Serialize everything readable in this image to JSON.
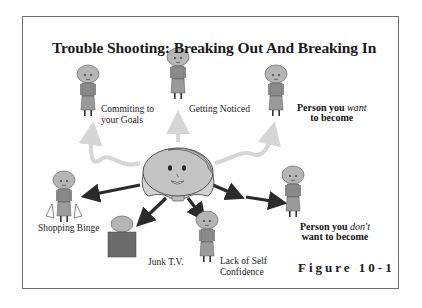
{
  "diagram": {
    "title": "Trouble Shooting: Breaking Out And Breaking In",
    "figure_label": "Figure 10-1",
    "center": {
      "name": "self-face",
      "description": "Central smiling face with bob haircut"
    },
    "positive_paths": [
      {
        "id": "commiting",
        "line1": "Commiting to",
        "line2": "your Goals",
        "arrow": "light-gray-wavy"
      },
      {
        "id": "noticed",
        "line1": "Getting Noticed",
        "arrow": "light-gray-straight"
      },
      {
        "id": "want",
        "line1_pre": "Person you ",
        "line1_em": "want",
        "line2": "to become",
        "arrow": "light-gray-wavy"
      }
    ],
    "negative_paths": [
      {
        "id": "shopping",
        "line1": "Shopping Binge",
        "arrow": "dark"
      },
      {
        "id": "junk-tv",
        "line1": "Junk T.V.",
        "arrow": "dark"
      },
      {
        "id": "confidence",
        "line1": "Lack of Self",
        "line2": "Confidence",
        "arrow": "dark"
      },
      {
        "id": "dont-want",
        "line1_pre": "Person you ",
        "line1_em": "don't",
        "line2": "want to become",
        "arrow": "dark-double"
      }
    ],
    "colors": {
      "frame": "#6e6e6e",
      "dark_arrow": "#2b2b2b",
      "light_arrow": "#d6d6d6",
      "figure_fill": "#9a9a9a",
      "face_fill": "#c4c4c4",
      "tv_fill": "#6b6b6b"
    }
  }
}
